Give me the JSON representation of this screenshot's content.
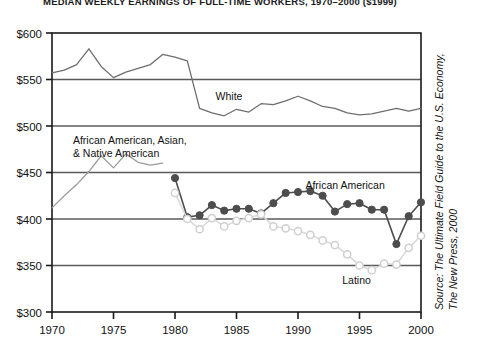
{
  "chart_data": {
    "type": "line",
    "title": "MEDIAN WEEKLY EARNINGS OF FULL-TIME WORKERS, 1970–2000 ($1999)",
    "xlabel": "",
    "ylabel": "",
    "xlim": [
      1970,
      2000
    ],
    "ylim": [
      300,
      600
    ],
    "yticks": [
      300,
      350,
      400,
      450,
      500,
      550,
      600
    ],
    "ytick_labels": [
      "$300",
      "$350",
      "$400",
      "$450",
      "$500",
      "$550",
      "$600"
    ],
    "xticks": [
      1970,
      1975,
      1980,
      1985,
      1990,
      1995,
      2000
    ],
    "xtick_labels": [
      "1970",
      "1975",
      "1980",
      "1985",
      "1990",
      "1995",
      "2000"
    ],
    "grid": true,
    "grid_axis": "y",
    "legend": "inline-annotations",
    "series": [
      {
        "name": "White",
        "color": "#6e6e6e",
        "marker": "none",
        "x": [
          1970,
          1971,
          1972,
          1973,
          1974,
          1975,
          1976,
          1977,
          1978,
          1979,
          1980,
          1981,
          1982,
          1983,
          1984,
          1985,
          1986,
          1987,
          1988,
          1989,
          1990,
          1991,
          1992,
          1993,
          1994,
          1995,
          1996,
          1997,
          1998,
          1999,
          2000
        ],
        "y": [
          557,
          560,
          566,
          583,
          564,
          552,
          558,
          562,
          566,
          577,
          574,
          570,
          519,
          514,
          511,
          518,
          515,
          524,
          523,
          527,
          532,
          527,
          521,
          519,
          514,
          512,
          513,
          516,
          519,
          516,
          519
        ]
      },
      {
        "name": "African American, Asian, & Native American",
        "color": "#9b9b9b",
        "marker": "none",
        "x": [
          1970,
          1971,
          1972,
          1973,
          1974,
          1975,
          1976,
          1977,
          1978,
          1979
        ],
        "y": [
          412,
          425,
          437,
          451,
          468,
          455,
          470,
          461,
          458,
          460
        ]
      },
      {
        "name": "African American",
        "color": "#4d4d4d",
        "marker": "filled-circle",
        "x": [
          1980,
          1981,
          1982,
          1983,
          1984,
          1985,
          1986,
          1987,
          1988,
          1989,
          1990,
          1991,
          1992,
          1993,
          1994,
          1995,
          1996,
          1997,
          1998,
          1999,
          2000
        ],
        "y": [
          444,
          402,
          404,
          415,
          409,
          411,
          411,
          406,
          417,
          428,
          429,
          430,
          425,
          408,
          416,
          417,
          410,
          410,
          373,
          403,
          418
        ]
      },
      {
        "name": "Latino",
        "color": "#d9d9d9",
        "marker": "open-circle",
        "x": [
          1980,
          1981,
          1982,
          1983,
          1984,
          1985,
          1986,
          1987,
          1988,
          1989,
          1990,
          1991,
          1992,
          1993,
          1994,
          1995,
          1996,
          1997,
          1998,
          1999,
          2000
        ],
        "y": [
          428,
          400,
          389,
          401,
          392,
          398,
          401,
          405,
          392,
          390,
          387,
          383,
          377,
          372,
          362,
          350,
          345,
          352,
          351,
          369,
          382
        ]
      }
    ],
    "annotations": [
      {
        "id": "anno-white",
        "text": "White",
        "x": 1983.3,
        "y": 528
      },
      {
        "id": "anno-combined-line1",
        "text": "African American, Asian,",
        "x": 1971.7,
        "y": 481
      },
      {
        "id": "anno-combined-line2",
        "text": "& Native American",
        "x": 1971.7,
        "y": 467
      },
      {
        "id": "anno-african-american",
        "text": "African American",
        "x": 1990.6,
        "y": 432
      },
      {
        "id": "anno-latino",
        "text": "Latino",
        "x": 1993.6,
        "y": 330
      }
    ],
    "source": "Source: The Ultimate Field Guide to the U.S. Economy, The New Press, 2000"
  }
}
